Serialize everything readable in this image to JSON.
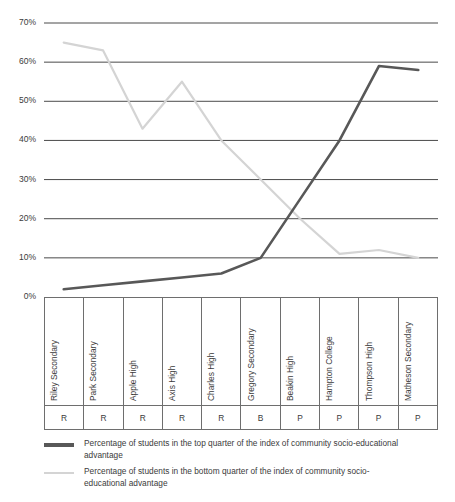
{
  "chart_data": {
    "type": "line",
    "title": "",
    "subtitle": "",
    "xlabel": "",
    "ylabel": "",
    "ylim": [
      0,
      70
    ],
    "ytick_labels": [
      "70%",
      "60%",
      "50%",
      "40%",
      "30%",
      "20%",
      "10%",
      "0%"
    ],
    "ytick_values": [
      70,
      60,
      50,
      40,
      30,
      20,
      10,
      0
    ],
    "grid": true,
    "legend_position": "bottom-left",
    "categories": [
      "Riley Secondary",
      "Park Secondary",
      "Apple High",
      "Axis High",
      "Charles High",
      "Gregory Secondary",
      "Beakin High",
      "Hampton College",
      "Thompson High",
      "Matheson Secondary"
    ],
    "sector_row": [
      "R",
      "R",
      "R",
      "R",
      "R",
      "B",
      "P",
      "P",
      "P",
      "P"
    ],
    "series": [
      {
        "name": "Percentage of students in the top quarter of the index of community socio-educational advantage",
        "color": "#585858",
        "values": [
          2,
          3,
          4,
          5,
          6,
          10,
          25,
          40,
          59,
          58
        ]
      },
      {
        "name": "Percentage of students in the bottom quarter of the index of community socio-educational advantage",
        "color": "#d4d4d4",
        "values": [
          65,
          63,
          43,
          55,
          40,
          30,
          20,
          11,
          12,
          10
        ]
      }
    ]
  },
  "legend": {
    "entries": [
      {
        "label": "Percentage of students in the top quarter of the index of community socio-educational advantage",
        "color": "#585858"
      },
      {
        "label": "Percentage of students in the bottom quarter of the index of community socio-educational advantage",
        "color": "#d4d4d4"
      }
    ]
  },
  "colors": {
    "series_top_quarter": "#585858",
    "series_bottom_quarter": "#d4d4d4",
    "gridline": "#4a4a4a",
    "text": "#3b3b3b",
    "table_border": "#6e6e6e",
    "background": "#ffffff"
  }
}
